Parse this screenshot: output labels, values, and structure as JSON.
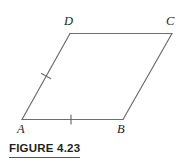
{
  "figure": {
    "caption": "FIGURE 4.23",
    "shape_name": "parallelogram",
    "stroke_color": "#6d6e71",
    "label_color": "#231f20",
    "rule_color": "#58595b",
    "background": "#ffffff",
    "vertices": [
      {
        "name": "A",
        "label": "A",
        "x": 22,
        "y": 119
      },
      {
        "name": "B",
        "label": "B",
        "x": 123,
        "y": 119
      },
      {
        "name": "C",
        "label": "C",
        "x": 172,
        "y": 33
      },
      {
        "name": "D",
        "label": "D",
        "x": 70,
        "y": 33
      }
    ],
    "sides": [
      {
        "name": "AB",
        "from": "A",
        "to": "B",
        "tick_marks": 1
      },
      {
        "name": "BC",
        "from": "B",
        "to": "C",
        "tick_marks": 0
      },
      {
        "name": "CD",
        "from": "C",
        "to": "D",
        "tick_marks": 0
      },
      {
        "name": "DA",
        "from": "D",
        "to": "A",
        "tick_marks": 1
      }
    ],
    "tick_marks": [
      {
        "name": "tick-AB",
        "on_side": "AB",
        "x": 71,
        "y": 119,
        "orientation": "vertical"
      },
      {
        "name": "tick-AD",
        "on_side": "DA",
        "x": 46,
        "y": 76,
        "orientation": "perpendicular"
      }
    ]
  }
}
